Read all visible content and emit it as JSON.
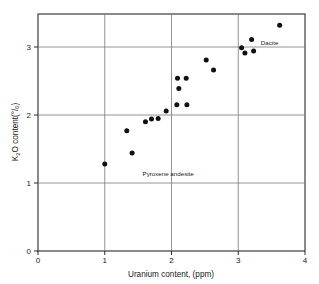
{
  "chart_data": {
    "type": "scatter",
    "title": "",
    "xlabel": "Uranium content, (ppm)",
    "ylabel_main": "O content",
    "ylabel_prefix": "K",
    "ylabel_sub": "2",
    "ylabel_units": "(°/ₒ)",
    "ylabel_full": "K2O content (°/o)",
    "xlim": [
      0,
      4
    ],
    "ylim": [
      0,
      3.45
    ],
    "xticks": [
      0,
      1,
      2,
      3,
      4
    ],
    "xtick_labels": [
      "0",
      "1",
      "2",
      "3",
      "4"
    ],
    "yticks": [
      0,
      1,
      2,
      3
    ],
    "ytick_labels": [
      "0",
      "1",
      "2",
      "3"
    ],
    "grid": true,
    "grid_x_values": [
      1,
      2,
      3
    ],
    "grid_y_values": [
      1,
      2,
      3
    ],
    "legend": null,
    "marker": "filled-circle",
    "marker_color": "#101010",
    "marker_size": 4.6,
    "points": [
      {
        "x": 1.0,
        "y": 1.28
      },
      {
        "x": 1.33,
        "y": 1.77
      },
      {
        "x": 1.41,
        "y": 1.44
      },
      {
        "x": 1.61,
        "y": 1.9
      },
      {
        "x": 1.7,
        "y": 1.94
      },
      {
        "x": 1.8,
        "y": 1.95
      },
      {
        "x": 1.92,
        "y": 2.06
      },
      {
        "x": 2.08,
        "y": 2.15
      },
      {
        "x": 2.09,
        "y": 2.54
      },
      {
        "x": 2.11,
        "y": 2.39
      },
      {
        "x": 2.22,
        "y": 2.54
      },
      {
        "x": 2.23,
        "y": 2.15
      },
      {
        "x": 2.52,
        "y": 2.81
      },
      {
        "x": 2.63,
        "y": 2.66
      },
      {
        "x": 3.05,
        "y": 2.99
      },
      {
        "x": 3.1,
        "y": 2.91
      },
      {
        "x": 3.2,
        "y": 3.11
      },
      {
        "x": 3.23,
        "y": 2.94
      },
      {
        "x": 3.62,
        "y": 3.32
      }
    ],
    "annotations": [
      {
        "text": "Dacite",
        "x": 3.47,
        "y": 3.03
      },
      {
        "text": "Pyroxene andesite",
        "x": 1.95,
        "y": 1.1
      }
    ]
  },
  "axes": {
    "x_label": "Uranium content, (ppm)",
    "y_label_prefix": "K",
    "y_label_sub": "2",
    "y_label_rest": "O content",
    "y_label_units": "(°/ₒ)",
    "xtick_labels": [
      "0",
      "1",
      "2",
      "3",
      "4"
    ],
    "ytick_labels": [
      "0",
      "1",
      "2",
      "3"
    ]
  },
  "annotations": {
    "dacite": "Dacite",
    "pyroxene_andesite": "Pyroxene andesite"
  },
  "colors": {
    "background": "#ffffff",
    "frame": "#2b2b2b",
    "grid": "#7a7a7a",
    "marker": "#101010",
    "text": "#1a1a1a"
  }
}
